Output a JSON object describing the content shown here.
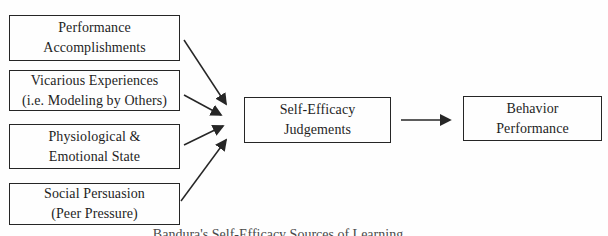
{
  "diagram": {
    "nodes": {
      "performance_accomplishments": {
        "line1": "Performance",
        "line2": "Accomplishments"
      },
      "vicarious_experiences": {
        "line1": "Vicarious Experiences",
        "line2": "(i.e. Modeling by Others)"
      },
      "physiological_emotional_state": {
        "line1": "Physiological &",
        "line2": "Emotional State"
      },
      "social_persuasion": {
        "line1": "Social Persuasion",
        "line2": "(Peer Pressure)"
      },
      "self_efficacy_judgements": {
        "line1": "Self-Efficacy",
        "line2": "Judgements"
      },
      "behavior_performance": {
        "line1": "Behavior",
        "line2": "Performance"
      }
    },
    "edges": [
      {
        "from": "performance_accomplishments",
        "to": "self_efficacy_judgements"
      },
      {
        "from": "vicarious_experiences",
        "to": "self_efficacy_judgements"
      },
      {
        "from": "physiological_emotional_state",
        "to": "self_efficacy_judgements"
      },
      {
        "from": "social_persuasion",
        "to": "self_efficacy_judgements"
      },
      {
        "from": "self_efficacy_judgements",
        "to": "behavior_performance"
      }
    ],
    "caption_cropped": "Bandura's Self-Efficacy Sources of Learning",
    "colors": {
      "stroke": "#262626",
      "background": "#fefefe",
      "text": "#1e1e1e"
    }
  }
}
